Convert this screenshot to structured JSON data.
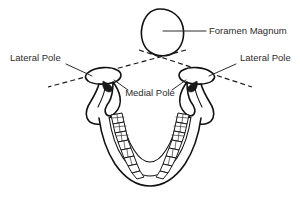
{
  "figure": {
    "background_color": "#ffffff",
    "line_color": "#111111",
    "text_color": "#2b2b2b"
  },
  "labels": {
    "foramen_magnum": "Foramen Magnum",
    "lateral_pole_left": "Lateral Pole",
    "lateral_pole_right": "Lateral Pole",
    "medial_pole": "Medial Pole"
  },
  "structures": {
    "foramen_magnum_shape": "irregular-oval",
    "mandible_shape": "u-shaped-dental-arch",
    "condyle_left": "mandibular-condyle-left",
    "condyle_right": "mandibular-condyle-right",
    "coronoid_left": "coronoid-process-left",
    "coronoid_right": "coronoid-process-right",
    "teeth_count_per_side": 8
  },
  "axes": {
    "condylar_axis_left": "dashed-line-through-left-condyle",
    "condylar_axis_right": "dashed-line-through-right-condyle",
    "crossing_point": "below-foramen-magnum"
  }
}
